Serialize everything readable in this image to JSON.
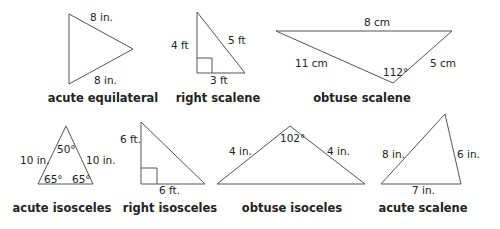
{
  "figure": {
    "triangles": [
      {
        "name": "acute equilateral",
        "points": "69,14 133,49 69,84",
        "labels": [
          {
            "text": "8 in.",
            "x": 90,
            "y": 21
          },
          {
            "text": "8 in.",
            "x": 94,
            "y": 84
          }
        ],
        "name_pos": {
          "x": 103,
          "y": 102
        }
      },
      {
        "name": "right scalene",
        "points": "197,12 245,73 197,73",
        "right_angle": "197,58 212,58 212,73",
        "labels": [
          {
            "text": "4 ft",
            "x": 171,
            "y": 49
          },
          {
            "text": "5 ft",
            "x": 228,
            "y": 44
          },
          {
            "text": "3 ft",
            "x": 210,
            "y": 84
          }
        ],
        "name_pos": {
          "x": 218,
          "y": 102
        }
      },
      {
        "name": "obtuse scalene",
        "points": "276,31 452,31 393,83",
        "labels": [
          {
            "text": "8 cm",
            "x": 364,
            "y": 26
          },
          {
            "text": "11 cm",
            "x": 295,
            "y": 67
          },
          {
            "text": "5 cm",
            "x": 430,
            "y": 67
          },
          {
            "text": "112°",
            "x": 383,
            "y": 76
          }
        ],
        "name_pos": {
          "x": 362,
          "y": 102
        }
      },
      {
        "name": "acute isosceles",
        "points": "66,126 93,184 38,184",
        "labels": [
          {
            "text": "10 in.",
            "x": 20,
            "y": 164
          },
          {
            "text": "10 in.",
            "x": 86,
            "y": 164
          },
          {
            "text": "50°",
            "x": 57,
            "y": 153
          },
          {
            "text": "65°",
            "x": 44,
            "y": 183
          },
          {
            "text": "65°",
            "x": 72,
            "y": 183
          }
        ],
        "name_pos": {
          "x": 62,
          "y": 212
        }
      },
      {
        "name": "right isosceles",
        "points": "141,122 205,184 141,184",
        "right_angle": "141,168 157,168 157,184",
        "labels": [
          {
            "text": "6 ft.",
            "x": 120,
            "y": 143
          },
          {
            "text": "6 ft.",
            "x": 159,
            "y": 194
          }
        ],
        "name_pos": {
          "x": 170,
          "y": 212
        }
      },
      {
        "name": "obtuse isoceles",
        "points": "290,126 365,184 217,184",
        "labels": [
          {
            "text": "4 in.",
            "x": 229,
            "y": 155
          },
          {
            "text": "4 in.",
            "x": 327,
            "y": 155
          },
          {
            "text": "102°",
            "x": 280,
            "y": 142
          }
        ],
        "name_pos": {
          "x": 292,
          "y": 212
        }
      },
      {
        "name": "acute scalene",
        "points": "445,114 461,184 381,184",
        "labels": [
          {
            "text": "8 in.",
            "x": 382,
            "y": 158
          },
          {
            "text": "6 in.",
            "x": 457,
            "y": 158
          },
          {
            "text": "7 in.",
            "x": 412,
            "y": 194
          }
        ],
        "name_pos": {
          "x": 423,
          "y": 212
        }
      }
    ]
  }
}
